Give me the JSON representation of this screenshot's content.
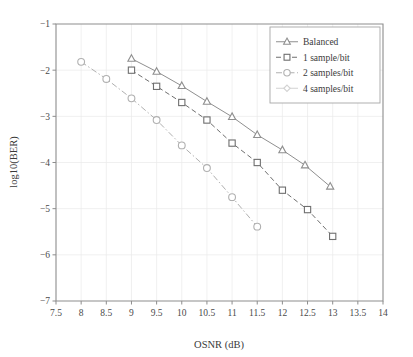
{
  "figure": {
    "background": "#ffffff",
    "plot_border_color": "#8d8d8d",
    "grid_color": "#e9e9e9"
  },
  "axes": {
    "x_title": "OSNR (dB)",
    "y_title": "log10(BER)",
    "x_ticks": [
      "7.5",
      "8",
      "8.5",
      "9",
      "9.5",
      "10",
      "10.5",
      "11",
      "11.5",
      "12",
      "12.5",
      "13",
      "13.5",
      "14"
    ],
    "y_ticks": [
      "−1",
      "−2",
      "−3",
      "−4",
      "−5",
      "−6",
      "−7"
    ]
  },
  "legend": {
    "position": "top-right",
    "entries": [
      {
        "label": "Balanced",
        "marker": "triangle",
        "line": "solid",
        "color": "#8f8f8f"
      },
      {
        "label": "1 sample/bit",
        "marker": "square",
        "line": "dashed",
        "color": "#6f6f6f"
      },
      {
        "label": "2 samples/bit",
        "marker": "circle",
        "line": "dashdot",
        "color": "#b0b0b0"
      },
      {
        "label": "4 samples/bit",
        "marker": "diamond",
        "line": "solid",
        "color": "#d2d2d2"
      }
    ]
  },
  "chart_data": {
    "type": "line",
    "title": "",
    "xlabel": "OSNR (dB)",
    "ylabel": "log10(BER)",
    "xlim": [
      7.5,
      14
    ],
    "ylim": [
      -7,
      -1
    ],
    "xtick_step": 0.5,
    "ytick_step": 1,
    "grid": true,
    "legend_position": "top-right",
    "series": [
      {
        "name": "Balanced",
        "marker": "triangle",
        "linestyle": "solid",
        "color": "#8f8f8f",
        "x": [
          9,
          9.5,
          10,
          10.5,
          11,
          11.5,
          12,
          12.45,
          12.95
        ],
        "y": [
          -1.75,
          -2.03,
          -2.34,
          -2.68,
          -3.01,
          -3.4,
          -3.73,
          -4.06,
          -4.52
        ]
      },
      {
        "name": "1 sample/bit",
        "marker": "square",
        "linestyle": "dashed",
        "color": "#6f6f6f",
        "x": [
          9,
          9.5,
          10,
          10.5,
          11,
          11.5,
          12,
          12.5,
          13
        ],
        "y": [
          -2.0,
          -2.35,
          -2.7,
          -3.08,
          -3.58,
          -4.0,
          -4.6,
          -5.02,
          -5.6
        ]
      },
      {
        "name": "2 samples/bit",
        "marker": "circle",
        "linestyle": "dashdot",
        "color": "#b0b0b0",
        "x": [
          8,
          8.5,
          9,
          9.5,
          10,
          10.5,
          11,
          11.5
        ],
        "y": [
          -1.82,
          -2.19,
          -2.61,
          -3.08,
          -3.63,
          -4.12,
          -4.75,
          -5.39
        ]
      }
    ]
  }
}
